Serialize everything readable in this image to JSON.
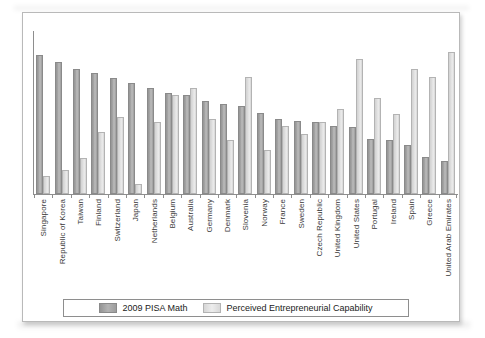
{
  "chart_data": {
    "type": "bar",
    "title": "",
    "subtitle": "",
    "xlabel": "",
    "ylabel": "",
    "ylim": [
      0,
      100
    ],
    "grid": false,
    "legend_position": "bottom",
    "categories": [
      "Singapore",
      "Republic of Korea",
      "Taiwan",
      "Finland",
      "Switzerland",
      "Japan",
      "Netherlands",
      "Belgium",
      "Australia",
      "Germany",
      "Denmark",
      "Slovenia",
      "Norway",
      "France",
      "Sweden",
      "Czech Republic",
      "United Kingdom",
      "United States",
      "Portugal",
      "Ireland",
      "Spain",
      "Greece",
      "United Arab Emirates"
    ],
    "series": [
      {
        "name": "2009 PISA Math",
        "color": "#a0a0a0",
        "values": [
          85,
          81,
          77,
          74,
          71,
          68,
          65,
          62,
          61,
          57,
          55,
          54,
          50,
          46,
          45,
          44,
          42,
          41,
          34,
          33,
          30,
          23,
          20
        ]
      },
      {
        "name": "Perceived Entrepreneurial Capability",
        "color": "#dcdcdc",
        "values": [
          11,
          15,
          22,
          38,
          47,
          6,
          44,
          61,
          65,
          46,
          33,
          72,
          27,
          42,
          37,
          44,
          52,
          83,
          59,
          49,
          77,
          72,
          87
        ]
      }
    ]
  },
  "legend": {
    "items": [
      {
        "label": "2009 PISA Math",
        "swatch": "dark"
      },
      {
        "label": "Perceived Entrepreneurial Capability",
        "swatch": "light"
      }
    ]
  }
}
